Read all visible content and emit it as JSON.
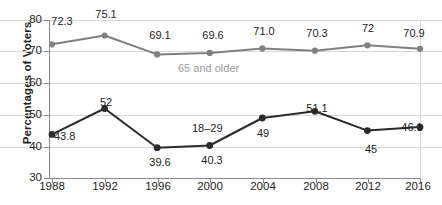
{
  "chart_data": {
    "type": "line",
    "title": "",
    "xlabel": "",
    "ylabel": "Percentages of Voters",
    "ylim": [
      30,
      80
    ],
    "yticks": [
      30,
      40,
      50,
      60,
      70,
      80
    ],
    "grid": true,
    "legend_position": "inline-annotation",
    "categories": [
      "1988",
      "1992",
      "1996",
      "2000",
      "2004",
      "2008",
      "2012",
      "2016"
    ],
    "series": [
      {
        "name": "65 and older",
        "color": "#808080",
        "values": [
          72.3,
          75.1,
          69.1,
          69.6,
          71.0,
          70.3,
          72,
          70.9
        ],
        "labels": [
          "72.3",
          "75.1",
          "69.1",
          "69.6",
          "71.0",
          "70.3",
          "72",
          "70.9"
        ]
      },
      {
        "name": "18–29",
        "color": "#2b2b2b",
        "values": [
          43.8,
          52,
          39.6,
          40.3,
          49,
          51.1,
          45,
          46.1
        ],
        "labels": [
          "43.8",
          "52",
          "39.6",
          "40.3",
          "49",
          "51.1",
          "45",
          "46.1"
        ]
      }
    ]
  },
  "axes": {
    "y_title": "Percentages of Voters",
    "y_tick_labels": [
      "80",
      "70",
      "60",
      "50",
      "40",
      "30"
    ],
    "x_tick_labels": [
      "1988",
      "1992",
      "1996",
      "2000",
      "2004",
      "2008",
      "2012",
      "2016"
    ]
  },
  "annotations": {
    "older_series_label": "65 and older",
    "younger_series_label": "18–29"
  },
  "data_labels": {
    "older": [
      "72.3",
      "75.1",
      "69.1",
      "69.6",
      "71.0",
      "70.3",
      "72",
      "70.9"
    ],
    "younger": [
      "43.8",
      "52",
      "39.6",
      "40.3",
      "49",
      "51.1",
      "45",
      "46.1"
    ]
  },
  "colors": {
    "older_series": "#808080",
    "younger_series": "#2b2b2b",
    "gridline": "#d7d7d7",
    "axis": "#8a8a8a",
    "text": "#231f20",
    "annotation_gray": "#9a9a9a"
  }
}
